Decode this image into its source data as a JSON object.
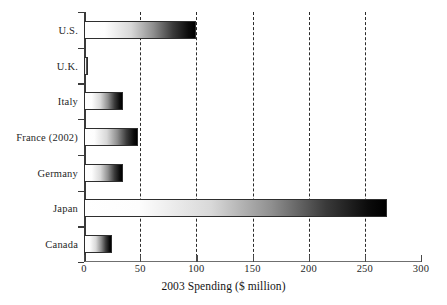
{
  "chart_data": {
    "type": "bar",
    "orientation": "horizontal",
    "title": "",
    "xlabel": "2003 Spending ($ million)",
    "ylabel": "",
    "categories": [
      "U.S.",
      "U.K.",
      "Italy",
      "France (2002)",
      "Germany",
      "Japan",
      "Canada"
    ],
    "values": [
      100,
      4,
      35,
      48,
      35,
      270,
      25
    ],
    "xlim": [
      0,
      300
    ],
    "xticks": [
      0,
      50,
      100,
      150,
      200,
      250,
      300
    ],
    "xtick_labels": [
      "0",
      "50",
      "100",
      "150",
      "200",
      "250",
      "300"
    ],
    "gridlines_at": [
      50,
      100,
      150,
      200,
      250
    ],
    "grid": true,
    "grid_style": "dashed-vertical",
    "legend": "none",
    "bar_fill": "white-to-black-gradient",
    "bar_outline_color": "#2e2e2e",
    "axis_color": "#3a3a3a"
  }
}
